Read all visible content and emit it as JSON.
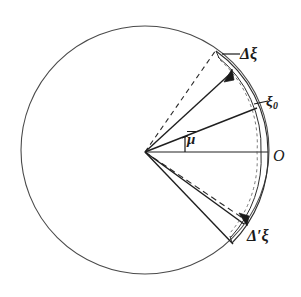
{
  "figure": {
    "type": "geometric-diagram",
    "background_color": "#ffffff",
    "stroke_color": "#3a3a3a",
    "text_color": "#1a1a1a"
  },
  "labels": {
    "delta_xi": "Δξ",
    "xi_zero_base": "ξ",
    "xi_zero_sub": "0",
    "mu_bar": "μ",
    "origin": "O",
    "delta_prime_xi": "Δ′ξ"
  },
  "geometry": {
    "circle": {
      "center_x": 145,
      "center_y": 150,
      "radius": 124,
      "stroke_width": 1.1
    },
    "vertex": {
      "x": 145,
      "y": 152
    },
    "point_O": {
      "x": 268,
      "y": 152
    },
    "point_xi0": {
      "x": 256,
      "y": 107
    },
    "point_delta_xi_tip": {
      "x": 230,
      "y": 72
    },
    "point_delta_xi_outer": {
      "x": 216,
      "y": 50
    },
    "point_delta_prime_xi_tip": {
      "x": 246,
      "y": 221
    },
    "point_delta_prime_xi_outer": {
      "x": 232,
      "y": 243
    },
    "angle_mu_marker": {
      "x": 186,
      "y": 136
    }
  },
  "elements": {
    "outer_circle": "outer-circle",
    "horizontal_radius": "radius-to-origin",
    "upper_solid_ray_xi0": "ray-to-xi0",
    "upper_solid_ray_delta": "ray-to-delta-xi",
    "upper_dashed_ray": "dashed-ray-upper",
    "lower_solid_ray_inner": "ray-lower-inner",
    "lower_solid_ray_outer": "ray-to-delta-prime-xi",
    "lower_dashed_ray": "dashed-ray-lower",
    "arc_sliver": "arc-sliver-lens",
    "upper_arrow": "delta-xi-arrowhead",
    "lower_arrow": "delta-prime-xi-arrowhead",
    "mu_tick": "mu-angle-tick",
    "leader_delta_xi": "leader-line-delta-xi",
    "leader_xi0": "leader-line-xi0"
  }
}
